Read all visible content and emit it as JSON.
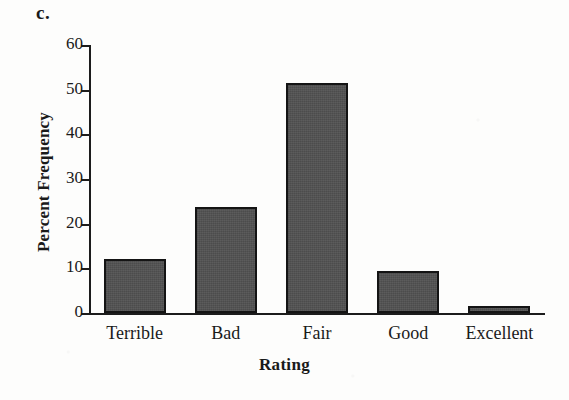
{
  "panel": {
    "letter": "c."
  },
  "chart_data": {
    "type": "bar",
    "title": "",
    "subtitle": "",
    "xlabel": "Rating",
    "ylabel": "Percent Frequency",
    "categories": [
      "Terrible",
      "Bad",
      "Fair",
      "Good",
      "Excellent"
    ],
    "values": [
      12.0,
      23.7,
      51.5,
      9.5,
      1.5
    ],
    "ylim": [
      0,
      60
    ],
    "ytick_labels": [
      "0",
      "10",
      "20",
      "30",
      "40",
      "50",
      "60"
    ],
    "ytick_values": [
      0,
      10,
      20,
      30,
      40,
      50,
      60
    ],
    "grid": false,
    "legend": false,
    "legend_position": "none",
    "bar_color": "#525252",
    "bar_edge_color": "#141414",
    "axis_color": "#1c1c1c",
    "annotations": []
  }
}
